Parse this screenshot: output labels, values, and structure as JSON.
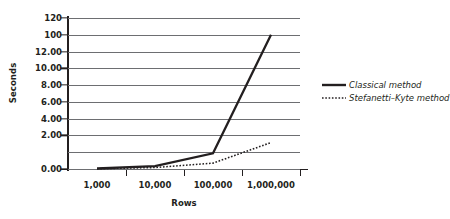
{
  "chart_data": {
    "type": "line",
    "title": "",
    "xlabel": "Rows",
    "ylabel": "Seconds",
    "grid": true,
    "legend_position": "right",
    "x_tick_labels": [
      "1,000",
      "10,000",
      "100,000",
      "1,000,000"
    ],
    "y_tick_labels": [
      "120",
      "100",
      "12.00",
      "10.00",
      "8.00",
      "6.00",
      "4.00",
      "2.00",
      "0.00"
    ],
    "x_categories": [
      1000,
      10000,
      100000,
      1000000
    ],
    "ylim": [
      0,
      120
    ],
    "series": [
      {
        "name": "Classical method",
        "style": "solid",
        "color": "#231f20",
        "x": [
          1000,
          10000,
          100000,
          1000000
        ],
        "values": [
          0.05,
          0.3,
          1.6,
          100
        ]
      },
      {
        "name": "Stefanetti–Kyte method",
        "style": "dotted",
        "color": "#231f20",
        "x": [
          1000,
          10000,
          100000,
          1000000
        ],
        "values": [
          0.03,
          0.15,
          0.6,
          2.7
        ]
      }
    ]
  },
  "legend": {
    "items": [
      {
        "label": "Classical method",
        "style": "solid"
      },
      {
        "label": "Stefanetti–Kyte method",
        "style": "dotted"
      }
    ]
  },
  "axes": {
    "y_title": "Seconds",
    "x_title": "Rows"
  }
}
